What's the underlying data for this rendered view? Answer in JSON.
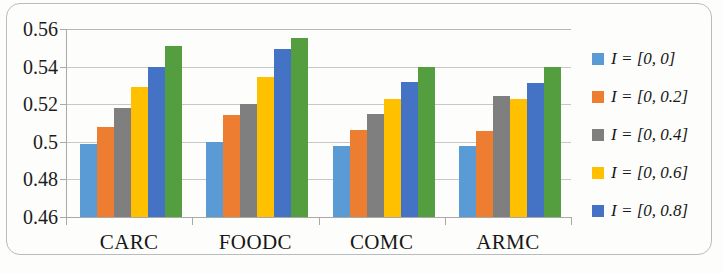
{
  "chart_data": {
    "type": "bar",
    "title": "",
    "subtitle": "",
    "xlabel": "",
    "ylabel": "",
    "categories": [
      "CARC",
      "FOODC",
      "COMC",
      "ARMC"
    ],
    "ylim": [
      0.46,
      0.56
    ],
    "ytick_labels": [
      "0.56",
      "0.54",
      "0.52",
      "0.5",
      "0.48",
      "0.46"
    ],
    "ytick_values": [
      0.56,
      0.54,
      0.52,
      0.5,
      0.48,
      0.46
    ],
    "grid": true,
    "legend_position": "right",
    "series": [
      {
        "name": "I = [0, 0]",
        "color": "#5B9BD5",
        "values": [
          0.499,
          0.5,
          0.498,
          0.498
        ]
      },
      {
        "name": "I = [0, 0.2]",
        "color": "#ED7D31",
        "values": [
          0.508,
          0.514,
          0.5065,
          0.5055
        ]
      },
      {
        "name": "I = [0, 0.4]",
        "color": "#7F7F7F",
        "values": [
          0.518,
          0.52,
          0.515,
          0.5245
        ]
      },
      {
        "name": "I = [0, 0.6]",
        "color": "#FFC000",
        "values": [
          0.529,
          0.5345,
          0.523,
          0.5228
        ]
      },
      {
        "name": "I = [0, 0.8]",
        "color": "#4472C4",
        "values": [
          0.54,
          0.5495,
          0.5317,
          0.5313
        ]
      },
      {
        "name": "",
        "color": "#549E3F",
        "values": [
          0.551,
          0.5552,
          0.54,
          0.54
        ]
      }
    ]
  },
  "legend": {
    "items": [
      {
        "label": "I = [0, 0]",
        "color": "#5B9BD5"
      },
      {
        "label": "I = [0, 0.2]",
        "color": "#ED7D31"
      },
      {
        "label": "I = [0, 0.4]",
        "color": "#7F7F7F"
      },
      {
        "label": "I = [0, 0.6]",
        "color": "#FFC000"
      },
      {
        "label": "I = [0, 0.8]",
        "color": "#4472C4"
      }
    ]
  }
}
